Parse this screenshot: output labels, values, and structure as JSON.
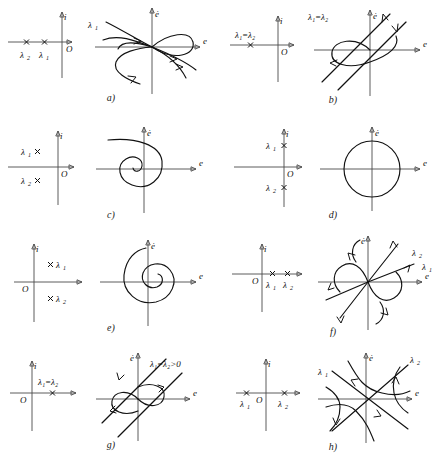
{
  "figure": {
    "axis_labels": {
      "complex_real": "",
      "complex_imag": "i",
      "origin": "O",
      "phase_x": "e",
      "phase_y": "ė"
    },
    "stroke_color": "#111111",
    "axis_color": "#4a4a4a",
    "background": "#ffffff"
  },
  "panels": [
    {
      "id": "a",
      "caption": "a)",
      "eigen_labels": [
        "λ",
        "λ"
      ],
      "eigen_subs": [
        "2",
        "1"
      ],
      "phase_label": "λ",
      "phase_sub": "1",
      "eigen_type": "real-negative-distinct",
      "phase_type": "stable-node",
      "description": "Two distinct negative real eigenvalues, stable node"
    },
    {
      "id": "b",
      "caption": "b)",
      "eigen_label": "λ₁=λ₂",
      "phase_label": "λ₁=λ₂",
      "eigen_type": "real-negative-repeated",
      "phase_type": "degenerate-stable-node",
      "description": "Repeated negative real eigenvalue, degenerate stable node"
    },
    {
      "id": "c",
      "caption": "c)",
      "eigen_labels": [
        "λ",
        "λ"
      ],
      "eigen_subs": [
        "1",
        "2"
      ],
      "eigen_type": "complex-negative-real-part",
      "phase_type": "stable-focus",
      "description": "Complex conjugate pair with negative real part, stable spiral"
    },
    {
      "id": "d",
      "caption": "d)",
      "eigen_labels": [
        "λ",
        "λ"
      ],
      "eigen_subs": [
        "1",
        "2"
      ],
      "eigen_type": "pure-imaginary",
      "phase_type": "center",
      "description": "Purely imaginary eigenvalues, center with closed circular orbit"
    },
    {
      "id": "e",
      "caption": "e)",
      "eigen_labels": [
        "λ",
        "λ"
      ],
      "eigen_subs": [
        "1",
        "2"
      ],
      "eigen_type": "complex-positive-real-part",
      "phase_type": "unstable-focus",
      "description": "Complex conjugate pair with positive real part, unstable spiral"
    },
    {
      "id": "f",
      "caption": "f)",
      "eigen_labels": [
        "λ",
        "λ"
      ],
      "eigen_subs": [
        "1",
        "2"
      ],
      "phase_labels": [
        "λ",
        "λ"
      ],
      "phase_subs": [
        "2",
        "1"
      ],
      "eigen_type": "real-positive-distinct",
      "phase_type": "unstable-node",
      "description": "Two distinct positive real eigenvalues, unstable node"
    },
    {
      "id": "g",
      "caption": "g)",
      "eigen_label": "λ₁=λ₂",
      "phase_label": "λ₁=λ₂>0",
      "eigen_type": "real-positive-repeated",
      "phase_type": "degenerate-unstable-node",
      "description": "Repeated positive real eigenvalue, degenerate unstable node"
    },
    {
      "id": "h",
      "caption": "h)",
      "eigen_labels": [
        "λ",
        "λ"
      ],
      "eigen_subs": [
        "1",
        "2"
      ],
      "phase_labels": [
        "λ",
        "λ"
      ],
      "phase_subs": [
        "1",
        "2"
      ],
      "eigen_type": "real-opposite-signs",
      "phase_type": "saddle",
      "description": "Real eigenvalues of opposite sign, saddle point"
    }
  ]
}
